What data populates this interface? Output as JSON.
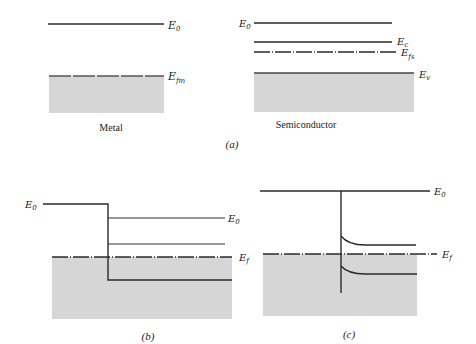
{
  "figure": {
    "panel_a": {
      "caption": "(a)",
      "metal": {
        "title": "Metal",
        "levels": [
          {
            "symbol": "E",
            "subscript": "0",
            "name": "vacuum-level"
          },
          {
            "symbol": "E",
            "subscript": "fm",
            "name": "metal-fermi-level"
          }
        ]
      },
      "semiconductor": {
        "title": "Semiconductor",
        "levels": [
          {
            "symbol": "E",
            "subscript": "0",
            "name": "vacuum-level"
          },
          {
            "symbol": "E",
            "subscript": "c",
            "name": "conduction-band-edge"
          },
          {
            "symbol": "E",
            "subscript": "fs",
            "name": "semiconductor-fermi-level"
          },
          {
            "symbol": "E",
            "subscript": "v",
            "name": "valence-band-edge"
          }
        ]
      }
    },
    "panel_b": {
      "caption": "(b)",
      "labels": {
        "left_e0": {
          "symbol": "E",
          "subscript": "0"
        },
        "right_e0": {
          "symbol": "E",
          "subscript": "0"
        },
        "ef": {
          "symbol": "E",
          "subscript": "f"
        }
      }
    },
    "panel_c": {
      "caption": "(c)",
      "labels": {
        "e0": {
          "symbol": "E",
          "subscript": "0"
        },
        "ef": {
          "symbol": "E",
          "subscript": "f"
        }
      }
    },
    "colors": {
      "line": "#2a2a2a",
      "fill": "#d6d6d6",
      "background": "#ffffff"
    }
  }
}
